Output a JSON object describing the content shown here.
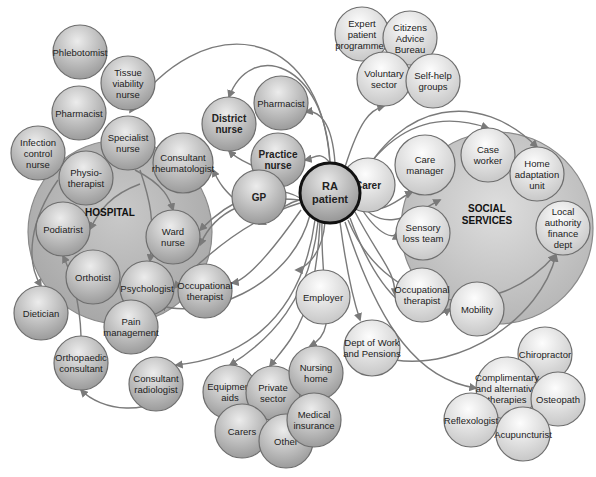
{
  "diagram": {
    "center": {
      "id": "ra",
      "label": [
        "RA",
        "patient"
      ],
      "x": 330,
      "y": 193,
      "r": 30
    },
    "groups": [
      {
        "id": "hospital",
        "label": "HOSPITAL",
        "x": 120,
        "y": 232,
        "r": 92,
        "label_x": 110,
        "label_y": 216,
        "fill": "#b8b8b8"
      },
      {
        "id": "social",
        "label": "SOCIAL SERVICES",
        "label_lines": [
          "SOCIAL",
          "SERVICES"
        ],
        "x": 497,
        "y": 228,
        "r": 96,
        "label_x": 487,
        "label_y": 212,
        "fill": "#c8c8c8"
      }
    ],
    "nodes": [
      {
        "id": "phlebotomist",
        "label": [
          "Phlebotomist"
        ],
        "x": 80,
        "y": 52,
        "r": 27,
        "tone": "mid"
      },
      {
        "id": "tissue",
        "label": [
          "Tissue",
          "viability",
          "nurse"
        ],
        "x": 128,
        "y": 83,
        "r": 27,
        "tone": "mid"
      },
      {
        "id": "pharmacist-h",
        "label": [
          "Pharmacist"
        ],
        "x": 79,
        "y": 113,
        "r": 27,
        "tone": "mid"
      },
      {
        "id": "infection",
        "label": [
          "Infection",
          "control",
          "nurse"
        ],
        "x": 38,
        "y": 153,
        "r": 27,
        "tone": "mid"
      },
      {
        "id": "specialist",
        "label": [
          "Specialist",
          "nurse"
        ],
        "x": 128,
        "y": 143,
        "r": 27,
        "tone": "mid"
      },
      {
        "id": "physio",
        "label": [
          "Physio-",
          "therapist"
        ],
        "x": 86,
        "y": 178,
        "r": 27,
        "tone": "mid"
      },
      {
        "id": "consultant-rheum",
        "label": [
          "Consultant",
          "rheumatologist"
        ],
        "x": 183,
        "y": 163,
        "r": 30,
        "tone": "mid"
      },
      {
        "id": "podiatrist",
        "label": [
          "Podiatrist"
        ],
        "x": 63,
        "y": 229,
        "r": 27,
        "tone": "mid"
      },
      {
        "id": "ward-nurse",
        "label": [
          "Ward",
          "nurse"
        ],
        "x": 173,
        "y": 237,
        "r": 27,
        "tone": "mid"
      },
      {
        "id": "orthotist",
        "label": [
          "Orthotist"
        ],
        "x": 93,
        "y": 277,
        "r": 27,
        "tone": "mid"
      },
      {
        "id": "psychologist",
        "label": [
          "Psychologist"
        ],
        "x": 147,
        "y": 288,
        "r": 27,
        "tone": "mid"
      },
      {
        "id": "occ-ther-h",
        "label": [
          "Occupational",
          "therapist"
        ],
        "x": 205,
        "y": 291,
        "r": 27,
        "tone": "mid"
      },
      {
        "id": "dietician",
        "label": [
          "Dietician"
        ],
        "x": 41,
        "y": 313,
        "r": 27,
        "tone": "mid"
      },
      {
        "id": "pain",
        "label": [
          "Pain",
          "management"
        ],
        "x": 131,
        "y": 327,
        "r": 27,
        "tone": "mid"
      },
      {
        "id": "ortho-consult",
        "label": [
          "Orthopaedic",
          "consultant"
        ],
        "x": 81,
        "y": 363,
        "r": 27,
        "tone": "mid"
      },
      {
        "id": "consult-radio",
        "label": [
          "Consultant",
          "radiologist"
        ],
        "x": 156,
        "y": 384,
        "r": 27,
        "tone": "mid"
      },
      {
        "id": "district",
        "label": [
          "District",
          "nurse"
        ],
        "x": 229,
        "y": 124,
        "r": 27,
        "tone": "mid",
        "bold": true
      },
      {
        "id": "pharmacist-c",
        "label": [
          "Pharmacist"
        ],
        "x": 281,
        "y": 103,
        "r": 27,
        "tone": "mid"
      },
      {
        "id": "practice",
        "label": [
          "Practice",
          "nurse"
        ],
        "x": 278,
        "y": 160,
        "r": 27,
        "tone": "mid",
        "bold": true
      },
      {
        "id": "gp",
        "label": [
          "GP"
        ],
        "x": 259,
        "y": 197,
        "r": 27,
        "tone": "mid",
        "bold": true
      },
      {
        "id": "employer",
        "label": [
          "Employer"
        ],
        "x": 323,
        "y": 297,
        "r": 27,
        "tone": "light"
      },
      {
        "id": "carer",
        "label": [
          "Carer"
        ],
        "x": 368,
        "y": 185,
        "r": 27,
        "tone": "light",
        "bold": true
      },
      {
        "id": "expert",
        "label": [
          "Expert",
          "patient",
          "programmes"
        ],
        "x": 362,
        "y": 34,
        "r": 27,
        "tone": "light"
      },
      {
        "id": "citizens",
        "label": [
          "Citizens",
          "Advice",
          "Bureau"
        ],
        "x": 410,
        "y": 38,
        "r": 27,
        "tone": "light"
      },
      {
        "id": "voluntary",
        "label": [
          "Voluntary",
          "sector"
        ],
        "x": 384,
        "y": 79,
        "r": 27,
        "tone": "light"
      },
      {
        "id": "selfhelp",
        "label": [
          "Self-help",
          "groups"
        ],
        "x": 433,
        "y": 81,
        "r": 27,
        "tone": "light"
      },
      {
        "id": "care-manager",
        "label": [
          "Care",
          "manager"
        ],
        "x": 425,
        "y": 165,
        "r": 30,
        "tone": "light"
      },
      {
        "id": "case-worker",
        "label": [
          "Case",
          "worker"
        ],
        "x": 488,
        "y": 155,
        "r": 27,
        "tone": "light"
      },
      {
        "id": "home-adapt",
        "label": [
          "Home",
          "adaptation",
          "unit"
        ],
        "x": 537,
        "y": 174,
        "r": 27,
        "tone": "light"
      },
      {
        "id": "sensory",
        "label": [
          "Sensory",
          "loss team"
        ],
        "x": 423,
        "y": 233,
        "r": 27,
        "tone": "light"
      },
      {
        "id": "local-auth",
        "label": [
          "Local",
          "authority",
          "finance",
          "dept"
        ],
        "x": 563,
        "y": 228,
        "r": 27,
        "tone": "light"
      },
      {
        "id": "occ-ther-s",
        "label": [
          "Occupational",
          "therapist"
        ],
        "x": 422,
        "y": 295,
        "r": 27,
        "tone": "light"
      },
      {
        "id": "mobility",
        "label": [
          "Mobility"
        ],
        "x": 477,
        "y": 309,
        "r": 27,
        "tone": "light"
      },
      {
        "id": "dwp",
        "label": [
          "Dept of Work",
          "and Pensions"
        ],
        "x": 372,
        "y": 348,
        "r": 28,
        "tone": "light"
      },
      {
        "id": "chiropractor",
        "label": [
          "Chiropractor"
        ],
        "x": 545,
        "y": 354,
        "r": 27,
        "tone": "light"
      },
      {
        "id": "comp-alt",
        "label": [
          "Complimentary",
          "and alternative",
          "therapies"
        ],
        "x": 507,
        "y": 388,
        "r": 31,
        "tone": "light"
      },
      {
        "id": "osteopath",
        "label": [
          "Osteopath"
        ],
        "x": 558,
        "y": 399,
        "r": 27,
        "tone": "light"
      },
      {
        "id": "reflexologist",
        "label": [
          "Reflexologist"
        ],
        "x": 471,
        "y": 420,
        "r": 27,
        "tone": "light"
      },
      {
        "id": "acupuncturist",
        "label": [
          "Acupuncturist"
        ],
        "x": 523,
        "y": 434,
        "r": 27,
        "tone": "light"
      },
      {
        "id": "equipment",
        "label": [
          "Equipment",
          "aids"
        ],
        "x": 230,
        "y": 392,
        "r": 27,
        "tone": "mid"
      },
      {
        "id": "private",
        "label": [
          "Private",
          "sector"
        ],
        "x": 273,
        "y": 393,
        "r": 27,
        "tone": "mid"
      },
      {
        "id": "nursing",
        "label": [
          "Nursing",
          "home"
        ],
        "x": 316,
        "y": 373,
        "r": 27,
        "tone": "mid"
      },
      {
        "id": "carers",
        "label": [
          "Carers"
        ],
        "x": 242,
        "y": 431,
        "r": 27,
        "tone": "mid"
      },
      {
        "id": "other",
        "label": [
          "Other"
        ],
        "x": 286,
        "y": 441,
        "r": 27,
        "tone": "mid"
      },
      {
        "id": "medical",
        "label": [
          "Medical",
          "insurance"
        ],
        "x": 314,
        "y": 420,
        "r": 27,
        "tone": "mid"
      }
    ],
    "edges": [
      {
        "d": "M330 163 C 320 20, 200 10, 130 112"
      },
      {
        "d": "M330 163 C 325 60, 250 40, 229 97"
      },
      {
        "d": "M335 163 C 332 120, 318 110, 306 112"
      },
      {
        "d": "M330 163 C 320 150, 315 158, 305 160"
      },
      {
        "d": "M302 199 C 280 205, 268 220, 259 224"
      },
      {
        "d": "M259 170 C 255 165, 240 162, 229 151"
      },
      {
        "d": "M232 197 C 225 190, 220 185, 213 170"
      },
      {
        "d": "M300 198 C 270 180, 230 200, 200 230"
      },
      {
        "d": "M300 200 C 250 195, 215 210, 200 245"
      },
      {
        "d": "M300 203 C 260 215, 220 240, 174 288"
      },
      {
        "d": "M301 210 C 280 240, 250 280, 232 283"
      },
      {
        "d": "M310 215 C 290 290, 200 320, 160 305"
      },
      {
        "d": "M315 220 C 300 330, 230 360, 176 365"
      },
      {
        "d": "M318 222 C 310 300, 270 340, 230 365"
      },
      {
        "d": "M320 222 C 315 320, 290 340, 270 366"
      },
      {
        "d": "M322 222 C 320 300, 340 330, 310 346"
      },
      {
        "d": "M325 222 C 322 260, 300 270, 296 270"
      },
      {
        "d": "M340 222 C 345 260, 350 290, 360 320"
      },
      {
        "d": "M358 200 C 380 220, 395 200, 412 192"
      },
      {
        "d": "M345 167 C 360 120, 370 110, 384 106"
      },
      {
        "d": "M358 185 C 400 100, 480 90, 537 147"
      },
      {
        "d": "M358 180 C 400 115, 450 115, 488 128"
      },
      {
        "d": "M358 198 C 380 240, 420 210, 440 200"
      },
      {
        "d": "M358 203 C 380 240, 396 238, 396 233"
      },
      {
        "d": "M355 212 C 380 260, 395 270, 395 295"
      },
      {
        "d": "M350 218 C 380 300, 420 330, 450 309"
      },
      {
        "d": "M348 220 C 390 320, 500 320, 555 255"
      },
      {
        "d": "M345 222 C 380 330, 420 380, 476 388"
      },
      {
        "d": "M395 360 C 460 370, 540 320, 556 255"
      },
      {
        "d": "M140 184 C 110 195, 100 210, 90 229"
      },
      {
        "d": "M58 180 C 30 220, 25 260, 41 286"
      },
      {
        "d": "M81 336 C 80 300, 70 270, 63 256"
      },
      {
        "d": "M180 384 C 150 420, 100 410, 81 390"
      },
      {
        "d": "M140 170 C 150 200, 155 220, 150 261"
      },
      {
        "d": "M135 170 C 165 185, 170 200, 173 210"
      }
    ],
    "colors": {
      "mid_fill_top": "#e6e6e6",
      "mid_fill_bottom": "#9c9c9c",
      "light_fill_top": "#fafafa",
      "light_fill_bottom": "#c8c8c8",
      "stroke": "#6e6e6e",
      "center_stroke": "#111111",
      "edge": "#7a7a7a"
    }
  }
}
